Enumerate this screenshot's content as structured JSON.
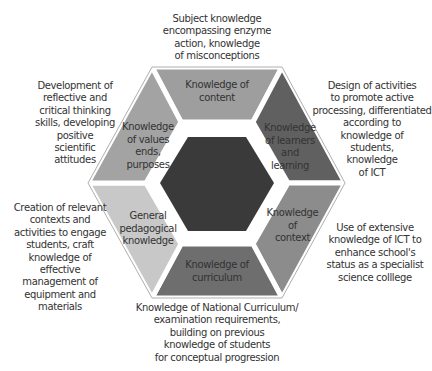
{
  "diagram": {
    "type": "hexagon-segment-diagram",
    "center": {
      "label": "",
      "color": "#3a3a3a"
    },
    "segments": [
      {
        "id": "content",
        "position": "top",
        "label_lines": [
          "Knowledge of",
          "content"
        ],
        "color": "#9e9e9e"
      },
      {
        "id": "learners",
        "position": "upper-right",
        "label_lines": [
          "Knowledge",
          "of learners",
          "and",
          "learning"
        ],
        "color": "#606060"
      },
      {
        "id": "context",
        "position": "lower-right",
        "label_lines": [
          "Knowledge",
          "of",
          "context"
        ],
        "color": "#8c8c8c"
      },
      {
        "id": "curriculum",
        "position": "bottom",
        "label_lines": [
          "Knowledge of",
          "curriculum"
        ],
        "color": "#6e6e6e"
      },
      {
        "id": "pedagogical",
        "position": "lower-left",
        "label_lines": [
          "General",
          "pedagogical",
          "knowledge"
        ],
        "color": "#c8c8c8"
      },
      {
        "id": "values",
        "position": "upper-left",
        "label_lines": [
          "Knowledge",
          "of values",
          "ends,",
          "purposes"
        ],
        "color": "#a3a3a3"
      }
    ],
    "annotations": [
      {
        "for": "content",
        "lines": [
          "Subject knowledge",
          "encompassing enzyme",
          "action, knowledge",
          "of misconceptions"
        ]
      },
      {
        "for": "learners",
        "lines": [
          "Design of activities",
          "to promote active",
          "processing, differentiated",
          "according to",
          "knowledge of",
          "students,",
          "knowledge",
          "of ICT"
        ]
      },
      {
        "for": "context",
        "lines": [
          "Use of extensive",
          "knowledge of ICT to",
          "enhance school's",
          "status as a specialist",
          "science colllege"
        ]
      },
      {
        "for": "curriculum",
        "lines": [
          "Knowledge of National Curriculum/",
          "examination requirements,",
          "building on previous",
          "knowledge of students",
          "for conceptual progression"
        ]
      },
      {
        "for": "pedagogical",
        "lines": [
          "Creation of relevant",
          "contexts and",
          "activities to engage",
          "students, craft",
          "knowledge of",
          "effective",
          "management of",
          "equipment and",
          "materials"
        ]
      },
      {
        "for": "values",
        "lines": [
          "Development of",
          "reflective and",
          "critical thinking",
          "skills, developing",
          "positive",
          "scientific",
          "attitudes"
        ]
      }
    ]
  }
}
